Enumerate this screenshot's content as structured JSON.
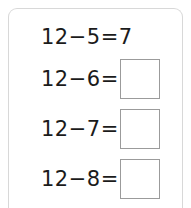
{
  "card": {
    "title": "subtraction-practice-card",
    "border_color": "#d8d8d8",
    "background_color": "#ffffff"
  },
  "style": {
    "text_color": "#1b1b1b",
    "box_border_color": "#9b9b9b"
  },
  "problems": [
    {
      "expression": "12−5=",
      "minuend": "12",
      "operator": "−",
      "subtrahend": "5",
      "equals": "=",
      "answer": "7",
      "answer_filled": true
    },
    {
      "expression": "12−6=",
      "minuend": "12",
      "operator": "−",
      "subtrahend": "6",
      "equals": "=",
      "answer": "",
      "answer_filled": false
    },
    {
      "expression": "12−7=",
      "minuend": "12",
      "operator": "−",
      "subtrahend": "7",
      "equals": "=",
      "answer": "",
      "answer_filled": false
    },
    {
      "expression": "12−8=",
      "minuend": "12",
      "operator": "−",
      "subtrahend": "8",
      "equals": "=",
      "answer": "",
      "answer_filled": false
    }
  ]
}
